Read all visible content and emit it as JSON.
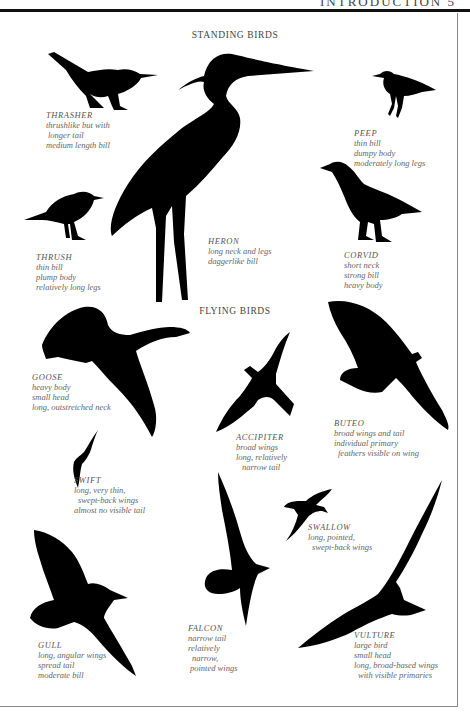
{
  "header": {
    "page_title_cut": "INTRODUCTION 5"
  },
  "sections": {
    "standing_title": "STANDING BIRDS",
    "flying_title": "FLYING BIRDS"
  },
  "standing_birds": [
    {
      "name": "THRASHER",
      "lines": [
        "thrushlike but with",
        "longer tail",
        "medium length bill"
      ]
    },
    {
      "name": "PEEP",
      "lines": [
        "thin bill",
        "dumpy body",
        "moderately long legs"
      ]
    },
    {
      "name": "THRUSH",
      "lines": [
        "thin bill",
        "plump body",
        "relatively long legs"
      ]
    },
    {
      "name": "HERON",
      "lines": [
        "long neck and legs",
        "daggerlike bill"
      ]
    },
    {
      "name": "CORVID",
      "lines": [
        "short neck",
        "strong bill",
        "heavy body"
      ]
    }
  ],
  "flying_birds": [
    {
      "name": "GOOSE",
      "lines": [
        "heavy body",
        "small head",
        "long, outstretched neck"
      ]
    },
    {
      "name": "ACCIPITER",
      "lines": [
        "broad wings",
        "long, relatively",
        "narrow tail"
      ]
    },
    {
      "name": "BUTEO",
      "lines": [
        "broad wings and tail",
        "individual primary",
        "feathers visible on wing"
      ]
    },
    {
      "name": "SWIFT",
      "lines": [
        "long, very thin,",
        "swept-back wings",
        "almost no visible tail"
      ]
    },
    {
      "name": "SWALLOW",
      "lines": [
        "long, pointed,",
        "swept-back wings"
      ]
    },
    {
      "name": "GULL",
      "lines": [
        "long, angular wings",
        "spread tail",
        "moderate bill"
      ]
    },
    {
      "name": "FALCON",
      "lines": [
        "narrow tail",
        "relatively",
        "narrow,",
        "pointed wings"
      ]
    },
    {
      "name": "VULTURE",
      "lines": [
        "large bird",
        "small head",
        "long, broad-based wings",
        "with visible primaries"
      ]
    }
  ]
}
